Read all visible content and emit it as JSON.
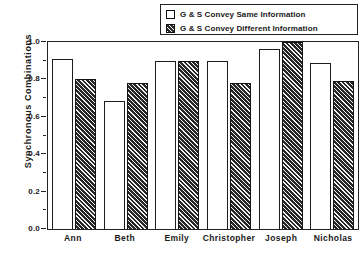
{
  "chart_data": {
    "type": "bar",
    "title": "",
    "xlabel": "",
    "ylabel": "Synchronous  Combinations",
    "ylim": [
      0.0,
      1.0
    ],
    "yticks": [
      "0.0",
      "0.2",
      "0.4",
      "0.6",
      "0.8",
      "1.0"
    ],
    "grid": false,
    "legend_position": "top-right",
    "categories": [
      "Ann",
      "Beth",
      "Emily",
      "Christopher",
      "Joseph",
      "Nicholas"
    ],
    "series": [
      {
        "name": "G & S Convey Same Information",
        "swatch": "white-open-square",
        "color": "#ffffff",
        "values": [
          0.91,
          0.685,
          0.9,
          0.9,
          0.96,
          0.89
        ]
      },
      {
        "name": "G & S Convey Different Information",
        "swatch": "hatched-dark-square",
        "color": "#262626",
        "values": [
          0.8,
          0.78,
          0.9,
          0.78,
          1.0,
          0.79
        ]
      }
    ]
  }
}
